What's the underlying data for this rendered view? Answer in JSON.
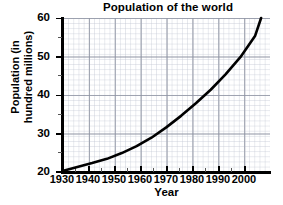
{
  "chart_data": {
    "type": "line",
    "title": "Population of the world",
    "xlabel": "Year",
    "ylabel": "Population (in hundred millions)",
    "ylabel_line1": "Population (in",
    "ylabel_line2": "hundred millions)",
    "xlim": [
      1930,
      2000
    ],
    "ylim": [
      20,
      60
    ],
    "xticks": [
      "1930",
      "1940",
      "1950",
      "1960",
      "1970",
      "1980",
      "1990",
      "2000"
    ],
    "yticks": [
      "20",
      "30",
      "40",
      "50",
      "60"
    ],
    "grid": true,
    "legend": "none",
    "series": [
      {
        "name": "World population",
        "color": "#000000",
        "x": [
          1930,
          1935,
          1940,
          1945,
          1950,
          1955,
          1960,
          1965,
          1970,
          1975,
          1980,
          1985,
          1990,
          1995,
          1997
        ],
        "values": [
          20.1,
          21.2,
          22.2,
          23.3,
          24.8,
          26.6,
          28.8,
          31.5,
          34.5,
          37.8,
          41.3,
          45.3,
          49.8,
          55.4,
          60.0
        ]
      }
    ]
  },
  "axes": {
    "y_tick_values": [
      20,
      30,
      40,
      50,
      60
    ],
    "x_tick_values": [
      1930,
      1940,
      1950,
      1960,
      1970,
      1980,
      1990,
      2000
    ]
  }
}
